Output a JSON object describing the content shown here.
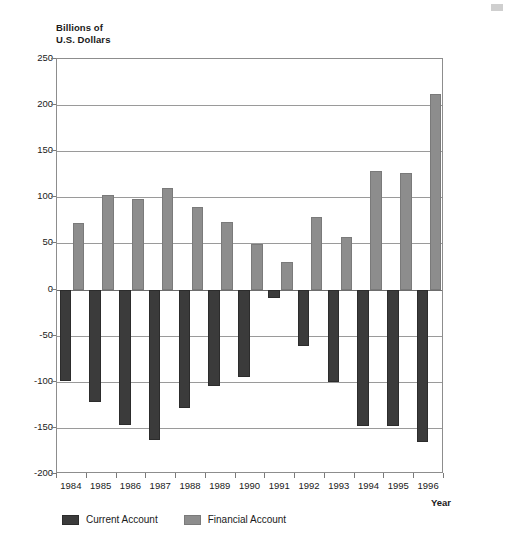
{
  "chart_data": {
    "type": "bar",
    "title": "",
    "ylabel": "Billions of\nU.S. Dollars",
    "xlabel": "Year",
    "ylim": [
      -200,
      250
    ],
    "ytick_step": 50,
    "yticks": [
      250,
      200,
      150,
      100,
      50,
      0,
      -50,
      -100,
      -150,
      -200
    ],
    "ytick_labels": [
      "250",
      "200",
      "150",
      "100",
      "50",
      "0",
      "-50",
      "-100",
      "-150",
      "-200"
    ],
    "grid": true,
    "legend_position": "bottom-left",
    "categories": [
      "1984",
      "1985",
      "1986",
      "1987",
      "1988",
      "1989",
      "1990",
      "1991",
      "1992",
      "1993",
      "1994",
      "1995",
      "1996"
    ],
    "series": [
      {
        "name": "Current Account",
        "color": "#3b3b3b",
        "values": [
          -99,
          -122,
          -147,
          -163,
          -128,
          -105,
          -95,
          -9,
          -61,
          -100,
          -148,
          -148,
          -165
        ]
      },
      {
        "name": "Financial Account",
        "color": "#8d8d8d",
        "values": [
          72,
          102,
          98,
          110,
          90,
          73,
          49,
          30,
          79,
          57,
          129,
          126,
          212
        ]
      }
    ]
  },
  "legend": {
    "items": [
      {
        "label": "Current Account",
        "key": "current"
      },
      {
        "label": "Financial Account",
        "key": "financial"
      }
    ]
  }
}
